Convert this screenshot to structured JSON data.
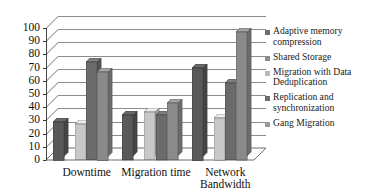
{
  "chart_data": {
    "type": "bar",
    "title": "",
    "subtitle": "",
    "xlabel": "",
    "ylabel": "",
    "ylim": [
      0,
      100
    ],
    "ytick_step": 10,
    "yticks": [
      "100",
      "90",
      "80",
      "70",
      "60",
      "50",
      "40",
      "30",
      "20",
      "10",
      "0"
    ],
    "grid": true,
    "grid_axis": "y",
    "legend_position": "right",
    "style": "3d-column",
    "categories": [
      "Downtime",
      "Migration time",
      "Network Bandwidth"
    ],
    "series": [
      {
        "name": "Adaptive memory compression",
        "color": "#595959",
        "values": [
          29,
          34,
          70
        ]
      },
      {
        "name": "Shared Storage",
        "color": "#7b7b7b",
        "values": [
          0,
          0,
          0
        ]
      },
      {
        "name": "Migration with Data Deduplication",
        "color": "#c8c8c8",
        "values": [
          27,
          36,
          32
        ]
      },
      {
        "name": "Replication and synchronization",
        "color": "#6b6b6b",
        "values": [
          74,
          34,
          58
        ]
      },
      {
        "name": "Gang Migration",
        "color": "#8a8a8a",
        "values": [
          67,
          43,
          97
        ]
      }
    ]
  },
  "legend": {
    "items": [
      {
        "label": "Adaptive memory compression",
        "color": "#6e6e6e"
      },
      {
        "label": "Shared Storage",
        "color": "#8c8c8c"
      },
      {
        "label": "Migration with Data Deduplication",
        "color": "#b9b9b9"
      },
      {
        "label": "Replication and synchronization",
        "color": "#6b6b6b"
      },
      {
        "label": "Gang Migration",
        "color": "#9a9a9a"
      }
    ]
  },
  "colors": {
    "plot_background": "#ffffff",
    "gridline": "#8c8c8c",
    "axis": "#3a3a3a",
    "text": "#111111"
  }
}
